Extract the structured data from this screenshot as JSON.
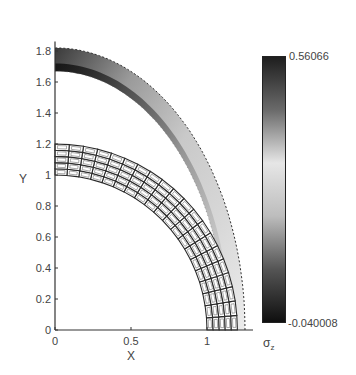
{
  "chart_data": {
    "type": "heatmap",
    "title": "",
    "xlabel": "X",
    "ylabel": "Y",
    "xlim": [
      0,
      1.3
    ],
    "ylim": [
      0,
      1.9
    ],
    "xticks": [
      0,
      0.5,
      1
    ],
    "xtick_labels": [
      "0",
      "0.5",
      "1"
    ],
    "yticks": [
      0,
      0.2,
      0.4,
      0.6,
      0.8,
      1,
      1.2,
      1.4,
      1.6,
      1.8
    ],
    "ytick_labels": [
      "0",
      "0.2",
      "0.4",
      "0.6",
      "0.8",
      "1",
      "1.2",
      "1.4",
      "1.6",
      "1.8"
    ],
    "grid": false,
    "mesh": {
      "description": "Quarter-annulus structured mesh (undeformed)",
      "inner_radius": 1.0,
      "outer_radius": 1.2,
      "radial_layers": 5,
      "angular_divisions": 20
    },
    "deformed_ring": {
      "description": "Deformed quarter ring shaded by sigma_z stress",
      "inner_x_intercept": 1.12,
      "outer_x_intercept": 1.25,
      "inner_y_intercept": 1.67,
      "outer_y_intercept": 1.82
    },
    "colorbar": {
      "label": "σz",
      "label_base": "σ",
      "label_sub": "z",
      "max": 0.56066,
      "min": -0.040008,
      "max_label": "0.56066",
      "min_label": "-0.040008",
      "colormap": "gray (dark at ends, light in middle)",
      "stops": [
        {
          "pos": 0.0,
          "color": "#1e1e1e"
        },
        {
          "pos": 0.2,
          "color": "#6a6a6a"
        },
        {
          "pos": 0.4,
          "color": "#e6e6e6"
        },
        {
          "pos": 0.6,
          "color": "#bdbdbd"
        },
        {
          "pos": 0.8,
          "color": "#555555"
        },
        {
          "pos": 1.0,
          "color": "#0f0f0f"
        }
      ]
    }
  }
}
